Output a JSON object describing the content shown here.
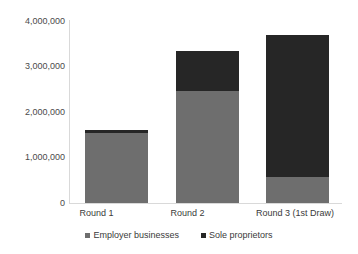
{
  "chart_data": {
    "type": "bar",
    "title": "",
    "subtitle": "",
    "xlabel": "",
    "ylabel": "",
    "stacked": true,
    "grid": false,
    "legend_position": "bottom",
    "ylim": [
      0,
      4000000
    ],
    "categories": [
      "Round 1",
      "Round 2",
      "Round 3 (1st Draw)"
    ],
    "ytick_labels": [
      "4,000,000",
      "3,000,000",
      "2,000,000",
      "1,000,000",
      "0"
    ],
    "ytick_values": [
      4000000,
      3000000,
      2000000,
      1000000,
      0
    ],
    "series": [
      {
        "name": "Employer businesses",
        "color": "#6e6e6e",
        "values": [
          1540000,
          2460000,
          570000
        ]
      },
      {
        "name": "Sole proprietors",
        "color": "#262626",
        "values": [
          60000,
          880000,
          3120000
        ]
      }
    ],
    "totals": [
      1600000,
      3340000,
      3690000
    ]
  },
  "legend": {
    "items": [
      {
        "label": "Employer businesses",
        "swatch": "legend-swatch-employer"
      },
      {
        "label": "Sole proprietors",
        "swatch": "legend-swatch-sole"
      }
    ]
  }
}
